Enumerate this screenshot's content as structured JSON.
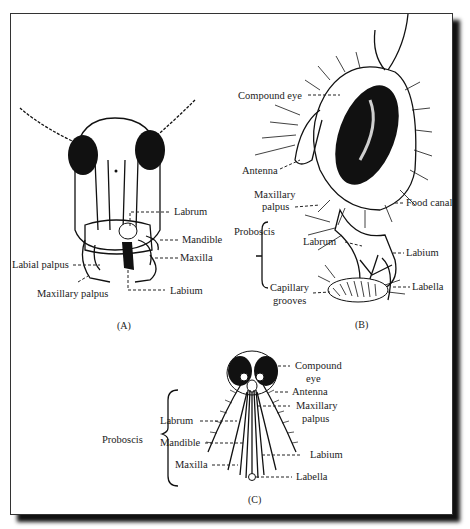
{
  "figure": {
    "panels": [
      {
        "id": "A",
        "caption": "(A)",
        "labels": {
          "labrum": "Labrum",
          "mandible": "Mandible",
          "maxilla": "Maxilla",
          "labial_palpus": "Labial palpus",
          "maxillary_palpus": "Maxillary palpus",
          "labium": "Labium"
        }
      },
      {
        "id": "B",
        "caption": "(B)",
        "labels": {
          "compound_eye": "Compound eye",
          "antenna": "Antenna",
          "maxillary_palpus_1": "Maxillary",
          "maxillary_palpus_2": "palpus",
          "food_canal": "Food canal",
          "proboscis": "Proboscis",
          "labrum": "Labrum",
          "labium": "Labium",
          "capillary_grooves_1": "Capillary",
          "capillary_grooves_2": "grooves",
          "labella": "Labella"
        }
      },
      {
        "id": "C",
        "caption": "(C)",
        "labels": {
          "compound_eye_1": "Compound",
          "compound_eye_2": "eye",
          "antenna": "Antenna",
          "maxillary_palpus_1": "Maxillary",
          "maxillary_palpus_2": "palpus",
          "proboscis": "Proboscis",
          "labrum": "Labrum",
          "mandible": "Mandible",
          "maxilla": "Maxilla",
          "labium": "Labium",
          "labella": "Labella"
        }
      }
    ]
  }
}
